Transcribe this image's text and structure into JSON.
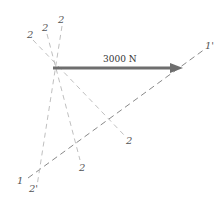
{
  "diagram": {
    "force_label": "3000 N",
    "labels": {
      "plane1_start": "1",
      "plane1_end": "1'",
      "plane2_top_a": "2",
      "plane2_top_b": "2",
      "plane2_top_c": "2",
      "plane2_bottom_a": "2'",
      "plane2_bottom_b": "2",
      "plane2_bottom_c": "2"
    },
    "colors": {
      "arrow": "#707070",
      "dashed_line": "#8a8a8a",
      "dashed_light": "#b5b5b5"
    }
  }
}
